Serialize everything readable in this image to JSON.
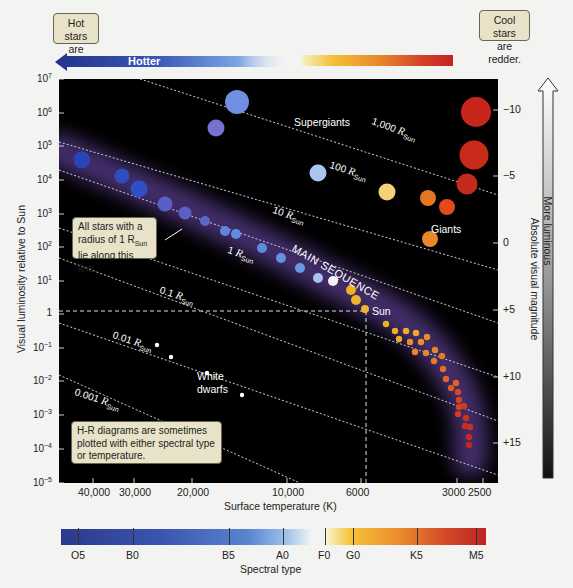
{
  "notes": {
    "hot": "Hot stars are bluer.",
    "cool": "Cool stars are redder.",
    "radius_callout": [
      "All stars with a",
      "radius of 1 R",
      "Sun",
      "lie along this line."
    ],
    "hr_note": "H-R diagrams are sometimes plotted with either spectral type or temperature."
  },
  "top_bar": {
    "hotter_label": "Hotter"
  },
  "axes": {
    "ylabel": "Visual luminosity relative to Sun",
    "xlabel": "Surface temperature (K)",
    "right_label": "Absolute visual magnitude",
    "legend_arrow_label": "More luminous",
    "spectral_title": "Spectral type"
  },
  "plot_labels": {
    "supergiants": "Supergiants",
    "giants": "Giants",
    "main_sequence": "MAIN SEQUENCE",
    "sun": "Sun",
    "white_dwarfs_1": "White",
    "white_dwarfs_2": "dwarfs"
  },
  "chart_data": {
    "type": "scatter",
    "xlabel": "Surface temperature (K)",
    "ylabel": "Visual luminosity relative to Sun",
    "y2label": "Absolute visual magnitude",
    "x_scale": "log, reversed (hot on left)",
    "y_scale": "log",
    "ylim": [
      1e-05,
      10000000.0
    ],
    "y_ticks": [
      {
        "label": "10",
        "exp": "7",
        "px": 79
      },
      {
        "label": "10",
        "exp": "6",
        "px": 113
      },
      {
        "label": "10",
        "exp": "5",
        "px": 146
      },
      {
        "label": "10",
        "exp": "4",
        "px": 180
      },
      {
        "label": "10",
        "exp": "3",
        "px": 214
      },
      {
        "label": "10",
        "exp": "2",
        "px": 247
      },
      {
        "label": "10",
        "exp": "1",
        "px": 281
      },
      {
        "label": "1",
        "exp": "",
        "px": 314
      },
      {
        "label": "10",
        "exp": "−1",
        "px": 348
      },
      {
        "label": "10",
        "exp": "−2",
        "px": 381
      },
      {
        "label": "10",
        "exp": "−3",
        "px": 415
      },
      {
        "label": "10",
        "exp": "−4",
        "px": 449
      },
      {
        "label": "10",
        "exp": "−5",
        "px": 483
      }
    ],
    "magnitude_ticks": [
      {
        "label": "−10",
        "px": 110
      },
      {
        "label": "−5",
        "px": 176
      },
      {
        "label": "0",
        "px": 243
      },
      {
        "label": "+5",
        "px": 310
      },
      {
        "label": "+10",
        "px": 377
      },
      {
        "label": "+15",
        "px": 443
      }
    ],
    "x_ticks": [
      {
        "label": "40,000",
        "px": 93
      },
      {
        "label": "30,000",
        "px": 134
      },
      {
        "label": "20,000",
        "px": 192
      },
      {
        "label": "10,000",
        "px": 287
      },
      {
        "label": "6000",
        "px": 361
      },
      {
        "label": "3000",
        "px": 457
      },
      {
        "label": "2500",
        "px": 483
      }
    ],
    "spectral_types": [
      {
        "label": "O5",
        "px": 78
      },
      {
        "label": "B0",
        "px": 133
      },
      {
        "label": "B5",
        "px": 229
      },
      {
        "label": "A0",
        "px": 283
      },
      {
        "label": "F0",
        "px": 325
      },
      {
        "label": "G0",
        "px": 353
      },
      {
        "label": "K5",
        "px": 417
      },
      {
        "label": "M5",
        "px": 476
      }
    ],
    "radius_lines": [
      {
        "label": "1,000",
        "x1": 140,
        "y1": 79,
        "x2": 498,
        "y2": 195,
        "lx": 372,
        "ly": 121,
        "rot": 20
      },
      {
        "label": "100",
        "x1": 59,
        "y1": 142,
        "x2": 498,
        "y2": 270,
        "lx": 330,
        "ly": 165,
        "rot": 18
      },
      {
        "label": "10",
        "x1": 59,
        "y1": 170,
        "x2": 498,
        "y2": 323,
        "lx": 273,
        "ly": 210,
        "rot": 18
      },
      {
        "label": "1",
        "x1": 59,
        "y1": 228,
        "x2": 498,
        "y2": 377,
        "lx": 228,
        "ly": 250,
        "rot": 18
      },
      {
        "label": "0.1",
        "x1": 59,
        "y1": 258,
        "x2": 498,
        "y2": 421,
        "lx": 160,
        "ly": 290,
        "rot": 18
      },
      {
        "label": "0.01",
        "x1": 59,
        "y1": 323,
        "x2": 498,
        "y2": 475,
        "lx": 113,
        "ly": 335,
        "rot": 18
      },
      {
        "label": "0.001",
        "x1": 59,
        "y1": 375,
        "x2": 300,
        "y2": 483,
        "lx": 75,
        "ly": 392,
        "rot": 18
      }
    ],
    "series": [
      {
        "name": "Supergiants",
        "points": [
          {
            "x": 237,
            "y": 102,
            "r": 12,
            "color": "#6f8fe0"
          },
          {
            "x": 216,
            "y": 128,
            "r": 8.5,
            "color": "#7a70d0"
          },
          {
            "x": 318,
            "y": 173,
            "r": 8.5,
            "color": "#a9c6ee"
          },
          {
            "x": 476,
            "y": 112,
            "r": 15,
            "color": "#c8261c"
          },
          {
            "x": 474,
            "y": 155,
            "r": 14.5,
            "color": "#c92a1a"
          },
          {
            "x": 467,
            "y": 184,
            "r": 10.5,
            "color": "#c22a1a"
          }
        ]
      },
      {
        "name": "Giants",
        "points": [
          {
            "x": 387,
            "y": 192,
            "r": 8.5,
            "color": "#f4d27a"
          },
          {
            "x": 428,
            "y": 198,
            "r": 8,
            "color": "#e37620"
          },
          {
            "x": 447,
            "y": 207,
            "r": 8,
            "color": "#e24a1a"
          },
          {
            "x": 430,
            "y": 239,
            "r": 8,
            "color": "#e8882a"
          }
        ]
      },
      {
        "name": "Main sequence",
        "points": [
          {
            "x": 82,
            "y": 160,
            "r": 8.5,
            "color": "#2a44b8"
          },
          {
            "x": 122,
            "y": 176,
            "r": 7.5,
            "color": "#2d4ec0"
          },
          {
            "x": 139,
            "y": 189,
            "r": 8.5,
            "color": "#2f50c4"
          },
          {
            "x": 165,
            "y": 204,
            "r": 7.5,
            "color": "#5a5ec8"
          },
          {
            "x": 185,
            "y": 213,
            "r": 6.5,
            "color": "#5b60c8"
          },
          {
            "x": 205,
            "y": 221,
            "r": 5,
            "color": "#5a68c8"
          },
          {
            "x": 225,
            "y": 231,
            "r": 5,
            "color": "#5c86dc"
          },
          {
            "x": 236,
            "y": 234,
            "r": 5,
            "color": "#5f8ee0"
          },
          {
            "x": 262,
            "y": 248,
            "r": 5,
            "color": "#5e8ddf"
          },
          {
            "x": 281,
            "y": 258,
            "r": 5,
            "color": "#6592e0"
          },
          {
            "x": 300,
            "y": 268,
            "r": 5,
            "color": "#6b98e2"
          },
          {
            "x": 318,
            "y": 278,
            "r": 5,
            "color": "#a5c2ee"
          },
          {
            "x": 333,
            "y": 281,
            "r": 5,
            "color": "#f4f4f8"
          },
          {
            "x": 351,
            "y": 290,
            "r": 5,
            "color": "#f0b020"
          },
          {
            "x": 356,
            "y": 300,
            "r": 5,
            "color": "#f0b428"
          },
          {
            "x": 365,
            "y": 309,
            "r": 4,
            "color": "#f0b428"
          }
        ]
      },
      {
        "name": "Red dwarfs",
        "points": [
          {
            "x": 386,
            "y": 324,
            "r": 3.2,
            "color": "#eeb028"
          },
          {
            "x": 395,
            "y": 331,
            "r": 3.2,
            "color": "#eeae28"
          },
          {
            "x": 406,
            "y": 331,
            "r": 3.2,
            "color": "#eeac28"
          },
          {
            "x": 416,
            "y": 333,
            "r": 3.2,
            "color": "#eeaa28"
          },
          {
            "x": 399,
            "y": 339,
            "r": 3.2,
            "color": "#eeac28"
          },
          {
            "x": 410,
            "y": 342,
            "r": 3.2,
            "color": "#e9902c"
          },
          {
            "x": 421,
            "y": 342,
            "r": 3.2,
            "color": "#e9902c"
          },
          {
            "x": 427,
            "y": 337,
            "r": 3.2,
            "color": "#e9902c"
          },
          {
            "x": 415,
            "y": 352,
            "r": 3.2,
            "color": "#e8862c"
          },
          {
            "x": 426,
            "y": 353,
            "r": 3.2,
            "color": "#e8862c"
          },
          {
            "x": 435,
            "y": 350,
            "r": 3.2,
            "color": "#e8862c"
          },
          {
            "x": 434,
            "y": 361,
            "r": 3.2,
            "color": "#e47a2a"
          },
          {
            "x": 442,
            "y": 356,
            "r": 3.2,
            "color": "#e47a2a"
          },
          {
            "x": 443,
            "y": 369,
            "r": 3.2,
            "color": "#e0702a"
          },
          {
            "x": 446,
            "y": 379,
            "r": 3.2,
            "color": "#de6428"
          },
          {
            "x": 456,
            "y": 383,
            "r": 3.2,
            "color": "#de6428"
          },
          {
            "x": 451,
            "y": 388,
            "r": 3.2,
            "color": "#da5a28"
          },
          {
            "x": 458,
            "y": 392,
            "r": 3.2,
            "color": "#d84a26"
          },
          {
            "x": 459,
            "y": 400,
            "r": 3.2,
            "color": "#d44426"
          },
          {
            "x": 459,
            "y": 407,
            "r": 3.2,
            "color": "#d44426"
          },
          {
            "x": 458,
            "y": 414,
            "r": 3.2,
            "color": "#d03a24"
          },
          {
            "x": 464,
            "y": 406,
            "r": 3.2,
            "color": "#d03a24"
          },
          {
            "x": 466,
            "y": 418,
            "r": 3.2,
            "color": "#cc3222"
          },
          {
            "x": 465,
            "y": 426,
            "r": 3.2,
            "color": "#c82e22"
          },
          {
            "x": 470,
            "y": 427,
            "r": 3.2,
            "color": "#c82e22"
          },
          {
            "x": 469,
            "y": 437,
            "r": 3.2,
            "color": "#c42a22"
          },
          {
            "x": 469,
            "y": 445,
            "r": 3.2,
            "color": "#c22822"
          }
        ]
      },
      {
        "name": "White dwarfs",
        "points": [
          {
            "x": 157,
            "y": 345,
            "r": 2.2,
            "color": "#ffffff"
          },
          {
            "x": 171,
            "y": 357,
            "r": 2.2,
            "color": "#ffffff"
          },
          {
            "x": 207,
            "y": 373,
            "r": 2.2,
            "color": "#ffffff"
          },
          {
            "x": 242,
            "y": 395,
            "r": 2.2,
            "color": "#ffffff"
          }
        ]
      }
    ],
    "sun_reference": {
      "temperature_K": 5800,
      "luminosity": 1,
      "magnitude": "+5",
      "x_px": 366,
      "y_px": 311
    },
    "grid": false
  },
  "colors": {
    "plot_bg": "#000000",
    "note_bg": "#e8e2c8",
    "hot_blue": "#2b3a8c",
    "cool_red": "#c32222",
    "main_sequence_glow": "#6a4a9a"
  }
}
